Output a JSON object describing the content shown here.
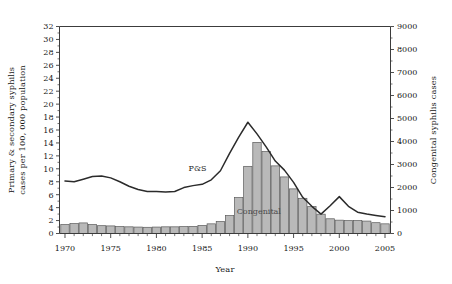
{
  "chart_data": {
    "type": "bar",
    "title": "",
    "xlabel": "Year",
    "ylabel": "Primary & secondary syphilis cases per 100, 000 population",
    "y2label": "Congenital syphilis cases",
    "xlim": [
      1969.4,
      2005.6
    ],
    "ylim": [
      0,
      32
    ],
    "y2lim": [
      0,
      9000
    ],
    "grid": false,
    "legend_position": "inline-annotation",
    "x_ticks": [
      1970,
      1975,
      1980,
      1985,
      1990,
      1995,
      2000,
      2005
    ],
    "x_tick_labels": [
      "1970",
      "1975",
      "1980",
      "1985",
      "1990",
      "1995",
      "2000",
      "2005"
    ],
    "x_minor_tick_step": 1,
    "y_ticks": [
      0,
      2,
      4,
      6,
      8,
      10,
      12,
      14,
      16,
      18,
      20,
      22,
      24,
      26,
      28,
      30,
      32
    ],
    "y_tick_labels": [
      "0",
      "2",
      "4",
      "6",
      "8",
      "10",
      "12",
      "14",
      "16",
      "18",
      "20",
      "22",
      "24",
      "26",
      "28",
      "30",
      "32"
    ],
    "y2_ticks": [
      0,
      1000,
      2000,
      3000,
      4000,
      5000,
      6000,
      7000,
      8000,
      9000
    ],
    "y2_tick_labels": [
      "0",
      "1000",
      "2000",
      "3000",
      "4000",
      "5000",
      "6000",
      "7000",
      "8000",
      "9000"
    ],
    "y2_minor_tick_step": 500,
    "categories": [
      1970,
      1971,
      1972,
      1973,
      1974,
      1975,
      1976,
      1977,
      1978,
      1979,
      1980,
      1981,
      1982,
      1983,
      1984,
      1985,
      1986,
      1987,
      1988,
      1989,
      1990,
      1991,
      1992,
      1993,
      1994,
      1995,
      1996,
      1997,
      1998,
      1999,
      2000,
      2001,
      2002,
      2003,
      2004,
      2005
    ],
    "series": [
      {
        "name": "Congenital",
        "label": "Congenital",
        "kind": "bar",
        "axis": "right",
        "units": "cases",
        "color": "#b9b9b9",
        "edge_color": "#5a5a5a",
        "values": [
          390,
          430,
          460,
          390,
          340,
          330,
          300,
          290,
          280,
          270,
          280,
          290,
          290,
          300,
          310,
          350,
          420,
          520,
          780,
          1560,
          2920,
          3960,
          3560,
          2940,
          2460,
          1940,
          1530,
          1170,
          840,
          640,
          580,
          560,
          560,
          540,
          470,
          420
        ]
      },
      {
        "name": "P&S",
        "label": "P&S",
        "kind": "line",
        "axis": "left",
        "units": "cases per 100,000 population",
        "color": "#2b2b2b",
        "values": [
          8.1,
          8.0,
          8.4,
          8.8,
          8.9,
          8.6,
          8.0,
          7.3,
          6.8,
          6.5,
          6.5,
          6.4,
          6.5,
          7.1,
          7.4,
          7.6,
          8.3,
          9.7,
          12.4,
          14.9,
          17.2,
          15.4,
          13.4,
          11.2,
          9.8,
          7.9,
          5.6,
          4.2,
          3.0,
          4.3,
          5.7,
          4.2,
          3.3,
          3.0,
          2.8,
          2.6
        ]
      }
    ],
    "annotations": [
      {
        "text": "P&S",
        "series": "P&S",
        "x": 1984.5,
        "y": 10.1
      },
      {
        "text": "Congenital",
        "series": "Congenital",
        "x": 1991.2,
        "y": 3.5
      }
    ]
  }
}
